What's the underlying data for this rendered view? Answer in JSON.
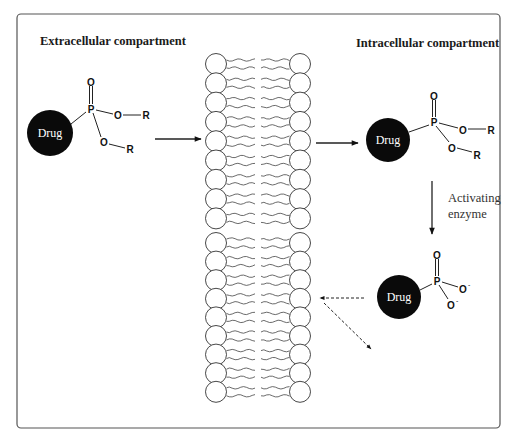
{
  "figure": {
    "frame": {
      "x": 17,
      "y": 14,
      "width": 483,
      "height": 414,
      "radius": 4,
      "stroke": "#555555"
    },
    "labels": {
      "extracellular": "Extracellular compartment",
      "intracellular": "Intracellular compartment",
      "enzyme_line1": "Activating",
      "enzyme_line2": "enzyme"
    },
    "colors": {
      "drug_fill": "#0a0a0a",
      "drug_text": "#ffffff",
      "line": "#222222",
      "membrane_stroke": "#333333"
    },
    "molecules": [
      {
        "id": "prodrug-extracellular",
        "drug_label": "Drug",
        "drug_center": [
          50,
          133
        ],
        "drug_radius": 23,
        "phosphorus": {
          "label": "P",
          "pos": [
            91,
            109
          ]
        },
        "oxo": {
          "label": "O",
          "pos": [
            91,
            82
          ]
        },
        "ester1": {
          "o_label": "O",
          "o_pos": [
            118,
            116
          ],
          "r_label": "R",
          "r_pos": [
            146,
            116
          ]
        },
        "ester2": {
          "o_label": "O",
          "o_pos": [
            104,
            143
          ],
          "r_label": "R",
          "r_pos": [
            130,
            150
          ]
        }
      },
      {
        "id": "prodrug-intracellular",
        "drug_label": "Drug",
        "drug_center": [
          388,
          140
        ],
        "drug_radius": 22,
        "phosphorus": {
          "label": "P",
          "pos": [
            434,
            122
          ]
        },
        "oxo": {
          "label": "O",
          "pos": [
            434,
            96
          ]
        },
        "ester1": {
          "o_label": "O",
          "o_pos": [
            463,
            130
          ],
          "r_label": "R",
          "r_pos": [
            491,
            130
          ]
        },
        "ester2": {
          "o_label": "O",
          "o_pos": [
            452,
            148
          ],
          "r_label": "R",
          "r_pos": [
            477,
            155
          ]
        }
      },
      {
        "id": "active-drug-phosphate",
        "drug_label": "Drug",
        "drug_center": [
          399,
          297
        ],
        "drug_radius": 22,
        "phosphorus": {
          "label": "P",
          "pos": [
            437,
            281
          ]
        },
        "oxo": {
          "label": "O",
          "pos": [
            437,
            255
          ]
        },
        "anion1": {
          "label": "O",
          "charge": "-",
          "pos": [
            463,
            289
          ]
        },
        "anion2": {
          "label": "O",
          "charge": "-",
          "pos": [
            451,
            305
          ]
        }
      }
    ],
    "arrows": [
      {
        "id": "arrow-into-membrane",
        "style": "solid",
        "from": [
          155,
          139
        ],
        "to": [
          201,
          139
        ]
      },
      {
        "id": "arrow-out-of-membrane",
        "style": "solid",
        "from": [
          316,
          143
        ],
        "to": [
          358,
          143
        ]
      },
      {
        "id": "arrow-activation",
        "style": "solid",
        "from": [
          432,
          181
        ],
        "to": [
          432,
          234
        ]
      },
      {
        "id": "arrow-efflux-dashed",
        "style": "dashed",
        "from": [
          364,
          298
        ],
        "to": [
          320,
          298
        ]
      },
      {
        "id": "arrow-diffuse-dashed",
        "style": "dashed",
        "from": [
          324,
          303
        ],
        "to": [
          371,
          349
        ]
      }
    ],
    "membrane": {
      "left_x": 216,
      "right_x": 300,
      "head_radius": 10.5,
      "top_rows_y": [
        64,
        83.3,
        102.6,
        121.9,
        141.2,
        160.5,
        179.8,
        199.1,
        218.4
      ],
      "bottom_rows_y": [
        243,
        261.6,
        280.2,
        298.8,
        317.4,
        336,
        354.6,
        373.2,
        391.8
      ]
    }
  }
}
